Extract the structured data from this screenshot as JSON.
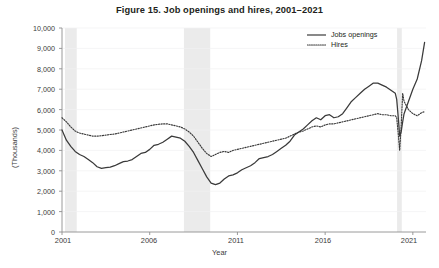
{
  "figure": {
    "title": "Figure 15.  Job openings and hires, 2001–2021"
  },
  "legend": {
    "position": "top-right",
    "items": [
      {
        "label": "Jobs openings",
        "style": "solid",
        "color": "#3a3a3a"
      },
      {
        "label": "Hires",
        "style": "dotted",
        "color": "#3a3a3a"
      }
    ]
  },
  "axes": {
    "y_title": "(Thousands)",
    "x_title": "Year",
    "y_ticks": [
      "0",
      "1,000",
      "2,000",
      "3,000",
      "4,000",
      "5,000",
      "6,000",
      "7,000",
      "8,000",
      "9,000",
      "10,000"
    ],
    "x_ticks": [
      "2001",
      "2006",
      "2011",
      "2016",
      "2021"
    ]
  },
  "chart_data": {
    "type": "line",
    "title": "Figure 15.  Job openings and hires, 2001–2021",
    "xlabel": "Year",
    "ylabel": "(Thousands)",
    "xlim": [
      2001,
      2021.75
    ],
    "ylim": [
      0,
      10000
    ],
    "ytick_step": 1000,
    "xticks": [
      2001,
      2006,
      2011,
      2016,
      2021
    ],
    "grid": "horizontal-faint",
    "units": "thousands of persons",
    "shaded_regions": [
      {
        "label": "recession-2001",
        "start": 2001.17,
        "end": 2001.84,
        "color": "#ebebeb"
      },
      {
        "label": "recession-2008",
        "start": 2007.95,
        "end": 2009.45,
        "color": "#ebebeb"
      },
      {
        "label": "recession-2020",
        "start": 2020.1,
        "end": 2020.37,
        "color": "#ebebeb"
      }
    ],
    "series": [
      {
        "name": "Jobs openings",
        "style": "solid",
        "color": "#3a3a3a",
        "x": [
          2001.0,
          2001.25,
          2001.5,
          2001.75,
          2002.0,
          2002.25,
          2002.5,
          2002.75,
          2003.0,
          2003.25,
          2003.5,
          2003.75,
          2004.0,
          2004.25,
          2004.5,
          2004.75,
          2005.0,
          2005.25,
          2005.5,
          2005.75,
          2006.0,
          2006.25,
          2006.5,
          2006.75,
          2007.0,
          2007.25,
          2007.5,
          2007.75,
          2008.0,
          2008.25,
          2008.5,
          2008.75,
          2009.0,
          2009.25,
          2009.5,
          2009.75,
          2010.0,
          2010.25,
          2010.5,
          2010.75,
          2011.0,
          2011.25,
          2011.5,
          2011.75,
          2012.0,
          2012.25,
          2012.5,
          2012.75,
          2013.0,
          2013.25,
          2013.5,
          2013.75,
          2014.0,
          2014.25,
          2014.5,
          2014.75,
          2015.0,
          2015.25,
          2015.5,
          2015.75,
          2016.0,
          2016.25,
          2016.5,
          2016.75,
          2017.0,
          2017.25,
          2017.5,
          2017.75,
          2018.0,
          2018.25,
          2018.5,
          2018.75,
          2019.0,
          2019.25,
          2019.5,
          2019.75,
          2020.0,
          2020.08,
          2020.17,
          2020.25,
          2020.33,
          2020.42,
          2020.5,
          2020.75,
          2021.0,
          2021.25,
          2021.5,
          2021.67
        ],
        "y": [
          5000,
          4500,
          4200,
          3950,
          3800,
          3700,
          3550,
          3400,
          3200,
          3120,
          3150,
          3180,
          3250,
          3350,
          3450,
          3480,
          3550,
          3700,
          3850,
          3900,
          4050,
          4250,
          4300,
          4400,
          4550,
          4700,
          4650,
          4600,
          4450,
          4200,
          3900,
          3500,
          3100,
          2700,
          2400,
          2320,
          2400,
          2600,
          2750,
          2800,
          2900,
          3050,
          3150,
          3250,
          3400,
          3600,
          3650,
          3700,
          3800,
          3950,
          4100,
          4250,
          4450,
          4750,
          4900,
          5050,
          5250,
          5450,
          5600,
          5500,
          5700,
          5750,
          5600,
          5650,
          5800,
          6100,
          6400,
          6600,
          6800,
          7000,
          7150,
          7300,
          7300,
          7200,
          7100,
          6950,
          6800,
          6500,
          5600,
          4700,
          4900,
          5400,
          5800,
          6400,
          7000,
          7500,
          8400,
          9300
        ],
        "key_points": {
          "start_2001": 5000,
          "trough_2003": 3120,
          "peak_2007": 4700,
          "trough_2009": 2320,
          "peak_2019": 7300,
          "covid_trough_2020": 4700,
          "end_2021": 9300
        }
      },
      {
        "name": "Hires",
        "style": "dotted",
        "color": "#3a3a3a",
        "x": [
          2001.0,
          2001.25,
          2001.5,
          2001.75,
          2002.0,
          2002.25,
          2002.5,
          2002.75,
          2003.0,
          2003.25,
          2003.5,
          2003.75,
          2004.0,
          2004.25,
          2004.5,
          2004.75,
          2005.0,
          2005.25,
          2005.5,
          2005.75,
          2006.0,
          2006.25,
          2006.5,
          2006.75,
          2007.0,
          2007.25,
          2007.5,
          2007.75,
          2008.0,
          2008.25,
          2008.5,
          2008.75,
          2009.0,
          2009.25,
          2009.5,
          2009.75,
          2010.0,
          2010.25,
          2010.5,
          2010.75,
          2011.0,
          2011.25,
          2011.5,
          2011.75,
          2012.0,
          2012.25,
          2012.5,
          2012.75,
          2013.0,
          2013.25,
          2013.5,
          2013.75,
          2014.0,
          2014.25,
          2014.5,
          2014.75,
          2015.0,
          2015.25,
          2015.5,
          2015.75,
          2016.0,
          2016.25,
          2016.5,
          2016.75,
          2017.0,
          2017.25,
          2017.5,
          2017.75,
          2018.0,
          2018.25,
          2018.5,
          2018.75,
          2019.0,
          2019.25,
          2019.5,
          2019.75,
          2020.0,
          2020.08,
          2020.17,
          2020.25,
          2020.33,
          2020.42,
          2020.5,
          2020.75,
          2021.0,
          2021.25,
          2021.5,
          2021.67
        ],
        "y": [
          5600,
          5400,
          5150,
          4950,
          4850,
          4800,
          4750,
          4700,
          4700,
          4720,
          4750,
          4780,
          4800,
          4850,
          4900,
          4950,
          5000,
          5050,
          5100,
          5150,
          5200,
          5250,
          5280,
          5300,
          5300,
          5250,
          5200,
          5150,
          5050,
          4900,
          4700,
          4400,
          4100,
          3850,
          3700,
          3800,
          3900,
          3950,
          3900,
          4000,
          4050,
          4100,
          4150,
          4200,
          4250,
          4300,
          4350,
          4400,
          4450,
          4500,
          4550,
          4600,
          4700,
          4800,
          4900,
          4950,
          5050,
          5150,
          5200,
          5150,
          5250,
          5300,
          5300,
          5350,
          5400,
          5450,
          5500,
          5550,
          5600,
          5650,
          5700,
          5750,
          5800,
          5750,
          5750,
          5700,
          5700,
          5600,
          4800,
          4000,
          5100,
          6800,
          6400,
          6000,
          5800,
          5700,
          5850,
          5900
        ],
        "key_points": {
          "start_2001": 5600,
          "trough_2003": 4700,
          "plateau_2007": 5300,
          "trough_2009": 3700,
          "peak_2019": 5800,
          "covid_trough_2020": 4000,
          "covid_spike_2020": 6800,
          "end_2021": 5900
        }
      }
    ]
  }
}
